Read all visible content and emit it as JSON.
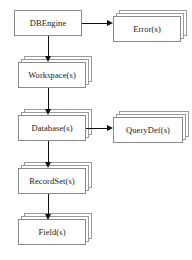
{
  "diagram": {
    "type": "hierarchy-flowchart",
    "background_color": "#ffffff",
    "border_color": "#9a9a9a",
    "text_color": "#1a1a1a",
    "arrow_color": "#111111",
    "nodes": [
      {
        "id": "dbengine",
        "label": "DBEngine",
        "stack_count": 1,
        "x": 14,
        "y": 10,
        "width": 68,
        "height": 26
      },
      {
        "id": "errors",
        "label": "Error(s)",
        "stack_count": 3,
        "x": 113,
        "y": 16,
        "width": 68,
        "height": 26
      },
      {
        "id": "workspaces",
        "label": "Workspace(s)",
        "stack_count": 3,
        "x": 18,
        "y": 62,
        "width": 68,
        "height": 26
      },
      {
        "id": "databases",
        "label": "Database(s)",
        "stack_count": 3,
        "x": 18,
        "y": 115,
        "width": 68,
        "height": 26
      },
      {
        "id": "querydefs",
        "label": "QueryDef(s)",
        "stack_count": 3,
        "x": 113,
        "y": 117,
        "width": 70,
        "height": 26
      },
      {
        "id": "recordsets",
        "label": "RecordSet(s)",
        "stack_count": 3,
        "x": 18,
        "y": 168,
        "width": 68,
        "height": 26
      },
      {
        "id": "fields",
        "label": "Field(s)",
        "stack_count": 3,
        "x": 18,
        "y": 219,
        "width": 68,
        "height": 26
      }
    ],
    "edges": [
      {
        "id": "dbengine-to-errors",
        "from": "dbengine",
        "to": "errors",
        "direction": "right"
      },
      {
        "id": "dbengine-to-workspaces",
        "from": "dbengine",
        "to": "workspaces",
        "direction": "down"
      },
      {
        "id": "workspaces-to-databases",
        "from": "workspaces",
        "to": "databases",
        "direction": "down"
      },
      {
        "id": "databases-to-querydefs",
        "from": "databases",
        "to": "querydefs",
        "direction": "right"
      },
      {
        "id": "databases-to-recordsets",
        "from": "databases",
        "to": "recordsets",
        "direction": "down"
      },
      {
        "id": "recordsets-to-fields",
        "from": "recordsets",
        "to": "fields",
        "direction": "down"
      }
    ]
  }
}
